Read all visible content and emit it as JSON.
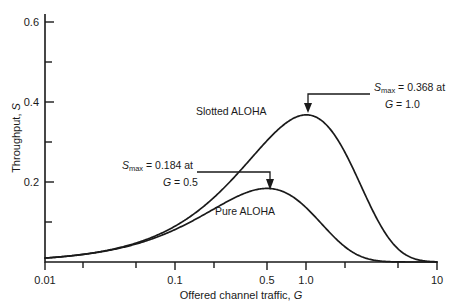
{
  "chart_data": {
    "type": "line",
    "title": "",
    "xlabel_plain": "Offered channel traffic, ",
    "xlabel_italic": "G",
    "ylabel_plain": "Throughput, ",
    "ylabel_italic": "S",
    "xscale": "log",
    "xlim": [
      0.01,
      10
    ],
    "ylim": [
      0.0,
      0.65
    ],
    "grid": false,
    "legend_position": "inline-labels",
    "xticks": [
      0.01,
      0.02,
      0.05,
      0.1,
      0.2,
      0.5,
      1.0,
      2,
      5,
      10
    ],
    "xtick_labels": [
      "0.01",
      "",
      "",
      "0.1",
      "",
      "0.5",
      "1.0",
      "",
      "",
      "10"
    ],
    "yticks": [
      0.0,
      0.1,
      0.2,
      0.3,
      0.4,
      0.5,
      0.6
    ],
    "ytick_labels": [
      "",
      "",
      "0.2",
      "",
      "0.4",
      "",
      "0.6"
    ],
    "series": [
      {
        "name": "Slotted ALOHA",
        "formula": "S = G * exp(-G)",
        "peak": {
          "x": 1.0,
          "y": 0.368
        },
        "x": [
          0.01,
          0.02,
          0.05,
          0.1,
          0.15,
          0.2,
          0.3,
          0.4,
          0.5,
          0.6,
          0.7,
          0.8,
          0.9,
          1.0,
          1.2,
          1.5,
          2.0,
          2.5,
          3.0,
          4.0,
          5.0,
          6.0,
          8.0,
          10.0
        ],
        "values": [
          0.0099,
          0.0196,
          0.0476,
          0.0905,
          0.1291,
          0.1637,
          0.2222,
          0.2681,
          0.3033,
          0.3293,
          0.3476,
          0.3595,
          0.3659,
          0.3679,
          0.3614,
          0.3347,
          0.2707,
          0.2052,
          0.1494,
          0.0733,
          0.0337,
          0.0149,
          0.0027,
          0.0005
        ]
      },
      {
        "name": "Pure ALOHA",
        "formula": "S = G * exp(-2G)",
        "peak": {
          "x": 0.5,
          "y": 0.184
        },
        "x": [
          0.01,
          0.02,
          0.05,
          0.1,
          0.15,
          0.2,
          0.3,
          0.4,
          0.5,
          0.6,
          0.7,
          0.8,
          0.9,
          1.0,
          1.2,
          1.5,
          2.0,
          2.5,
          3.0,
          4.0,
          5.0,
          6.0,
          8.0,
          10.0
        ],
        "values": [
          0.0098,
          0.0192,
          0.0452,
          0.0819,
          0.1111,
          0.1341,
          0.1646,
          0.1798,
          0.1839,
          0.1807,
          0.1726,
          0.1616,
          0.1488,
          0.1353,
          0.1089,
          0.0747,
          0.0366,
          0.0168,
          0.0074,
          0.0013,
          0.0002,
          0.0,
          0.0,
          0.0
        ]
      }
    ],
    "annotations": [
      {
        "id": "slotted-peak",
        "line1_prefix": "S",
        "line1_sub": "max",
        "line1_rest": " = 0.368 at",
        "line2_italic": "G",
        "line2_rest": " = 1.0",
        "points_to": {
          "x": 1.0,
          "y": 0.368
        }
      },
      {
        "id": "pure-peak",
        "line1_prefix": "S",
        "line1_sub": "max",
        "line1_rest": " = 0.184 at",
        "line2_italic": "G",
        "line2_rest": " = 0.5",
        "points_to": {
          "x": 0.5,
          "y": 0.184
        }
      }
    ],
    "curve_labels": [
      {
        "id": "slotted",
        "text": "Slotted ALOHA"
      },
      {
        "id": "pure",
        "text": "Pure ALOHA"
      }
    ],
    "colors": {
      "ink": "#1a1a1a",
      "background": "#ffffff"
    }
  }
}
